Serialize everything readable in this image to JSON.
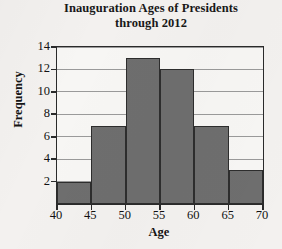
{
  "chart_data": {
    "type": "bar",
    "title": "Inauguration Ages of Presidents through 2012",
    "title_lines": [
      "Inauguration Ages of Presidents",
      "through 2012"
    ],
    "xlabel": "Age",
    "ylabel": "Frequency",
    "categories": [
      "40-45",
      "45-50",
      "50-55",
      "55-60",
      "60-65",
      "65-70"
    ],
    "bin_edges": [
      40,
      45,
      50,
      55,
      60,
      65,
      70
    ],
    "values": [
      2,
      7,
      13,
      12,
      7,
      3
    ],
    "xlim": [
      40,
      70
    ],
    "ylim": [
      0,
      14
    ],
    "xticks": [
      40,
      45,
      50,
      55,
      60,
      65,
      70
    ],
    "yticks": [
      2,
      4,
      6,
      8,
      10,
      12,
      14
    ],
    "xtick_labels": [
      "40",
      "45",
      "50",
      "55",
      "60",
      "65",
      "70"
    ],
    "ytick_labels": [
      "2",
      "4",
      "6",
      "8",
      "10",
      "12",
      "14"
    ],
    "grid": true,
    "grid_axis": "y",
    "legend": false,
    "bar_color": "#6e6e6e",
    "bar_edge_color": "#2d2d2d",
    "axis_color": "#2a2a2a",
    "grid_color": "#9a9a9a",
    "background_color": "#f3f1ef",
    "plot_background_color": "#f7f6f4"
  }
}
